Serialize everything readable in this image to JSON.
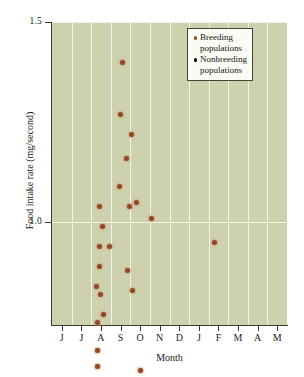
{
  "chart_data": {
    "type": "scatter",
    "title": "",
    "xlabel": "Month",
    "ylabel": "Food intake rate (mg/second)",
    "xlim": [
      0,
      12
    ],
    "ylim": [
      0.12,
      1.5
    ],
    "grid": true,
    "grid_orientation": "both",
    "legend_position": "top-right",
    "categories": [
      "J",
      "J",
      "A",
      "S",
      "O",
      "N",
      "D",
      "J",
      "F",
      "M",
      "A",
      "M"
    ],
    "x_tick_labels": [
      "J",
      "J",
      "A",
      "S",
      "O",
      "N",
      "D",
      "J",
      "F",
      "M",
      "A",
      "M"
    ],
    "y_tick_labels": [
      "0.5",
      "1.0",
      "1.5"
    ],
    "y_tick_values": [
      0.5,
      1.0,
      1.5
    ],
    "series": [
      {
        "name": "Breeding populations",
        "color": "#8c4a28",
        "marker": "circle",
        "points": [
          {
            "x": 1.0,
            "y": 0.27
          },
          {
            "x": 2.45,
            "y": 1.04
          },
          {
            "x": 2.6,
            "y": 0.99
          },
          {
            "x": 2.4,
            "y": 0.94
          },
          {
            "x": 2.45,
            "y": 0.89
          },
          {
            "x": 2.25,
            "y": 0.84
          },
          {
            "x": 2.5,
            "y": 0.82
          },
          {
            "x": 2.3,
            "y": 0.75
          },
          {
            "x": 2.65,
            "y": 0.77
          },
          {
            "x": 2.3,
            "y": 0.68
          },
          {
            "x": 2.3,
            "y": 0.64
          },
          {
            "x": 2.35,
            "y": 0.57
          },
          {
            "x": 2.3,
            "y": 0.52
          },
          {
            "x": 2.95,
            "y": 0.94
          },
          {
            "x": 3.6,
            "y": 1.4
          },
          {
            "x": 3.5,
            "y": 1.27
          },
          {
            "x": 3.45,
            "y": 1.09
          },
          {
            "x": 4.05,
            "y": 1.22
          },
          {
            "x": 3.8,
            "y": 1.16
          },
          {
            "x": 3.95,
            "y": 1.04
          },
          {
            "x": 4.3,
            "y": 1.05
          },
          {
            "x": 3.85,
            "y": 0.88
          },
          {
            "x": 4.1,
            "y": 0.83
          },
          {
            "x": 3.55,
            "y": 0.44
          },
          {
            "x": 4.5,
            "y": 0.63
          },
          {
            "x": 5.1,
            "y": 1.01
          },
          {
            "x": 8.3,
            "y": 0.95
          },
          {
            "x": 8.5,
            "y": 0.49
          },
          {
            "x": 9.15,
            "y": 0.5
          },
          {
            "x": 9.55,
            "y": 0.47
          },
          {
            "x": 10.8,
            "y": 0.46
          },
          {
            "x": 11.2,
            "y": 0.41
          },
          {
            "x": 11.7,
            "y": 0.42
          }
        ]
      },
      {
        "name": "Nonbreeding populations",
        "color": "#100f0c",
        "marker": "circle",
        "points": [
          {
            "x": 4.65,
            "y": 0.55
          },
          {
            "x": 4.6,
            "y": 0.53
          },
          {
            "x": 4.4,
            "y": 0.46
          },
          {
            "x": 4.2,
            "y": 0.44
          },
          {
            "x": 4.55,
            "y": 0.37
          },
          {
            "x": 4.35,
            "y": 0.31
          },
          {
            "x": 5.05,
            "y": 0.56
          },
          {
            "x": 4.95,
            "y": 0.47
          },
          {
            "x": 5.05,
            "y": 0.45
          },
          {
            "x": 4.85,
            "y": 0.42
          },
          {
            "x": 5.3,
            "y": 0.51
          },
          {
            "x": 5.25,
            "y": 0.41
          },
          {
            "x": 5.05,
            "y": 0.25
          },
          {
            "x": 6.9,
            "y": 0.5
          },
          {
            "x": 7.25,
            "y": 0.47
          },
          {
            "x": 7.75,
            "y": 0.47
          },
          {
            "x": 7.55,
            "y": 0.4
          },
          {
            "x": 8.15,
            "y": 0.35
          },
          {
            "x": 8.4,
            "y": 0.31
          },
          {
            "x": 8.05,
            "y": 0.28
          },
          {
            "x": 8.35,
            "y": 0.27
          },
          {
            "x": 8.75,
            "y": 0.3
          },
          {
            "x": 8.6,
            "y": 0.25
          },
          {
            "x": 8.6,
            "y": 0.23
          }
        ]
      }
    ]
  },
  "legend": {
    "items": [
      {
        "label": "Breeding\npopulations",
        "color": "#8c4a28",
        "key": "breeding"
      },
      {
        "label": "Nonbreeding\npopulations",
        "color": "#100f0c",
        "key": "nonbreeding"
      }
    ]
  },
  "axes": {
    "x_title": "Month",
    "y_title": "Food intake rate (mg/second)"
  },
  "colors": {
    "panel_background": "#cdd1ae",
    "gridline": "#f2f3e6",
    "axis": "#3a3a32",
    "breeding": "#8c4a28",
    "nonbreeding": "#100f0c",
    "figure_background": "#ffffff"
  }
}
